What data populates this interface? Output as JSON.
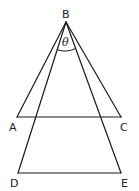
{
  "diagram": {
    "type": "geometry",
    "points": {
      "B": {
        "label": "B",
        "x": 66,
        "y": 22
      },
      "A": {
        "label": "A",
        "x": 17,
        "y": 117
      },
      "C": {
        "label": "C",
        "x": 121,
        "y": 117
      },
      "D": {
        "label": "D",
        "x": 18,
        "y": 173
      },
      "E": {
        "label": "E",
        "x": 121,
        "y": 173
      }
    },
    "segments": [
      [
        "B",
        "A"
      ],
      [
        "B",
        "C"
      ],
      [
        "A",
        "C"
      ],
      [
        "B",
        "D"
      ],
      [
        "B",
        "E"
      ],
      [
        "D",
        "E"
      ]
    ],
    "angle": {
      "label": "θ",
      "vertex": "B",
      "between": [
        "D",
        "E"
      ]
    },
    "labels": {
      "B": "B",
      "A": "A",
      "C": "C",
      "D": "D",
      "E": "E",
      "theta": "θ"
    }
  }
}
